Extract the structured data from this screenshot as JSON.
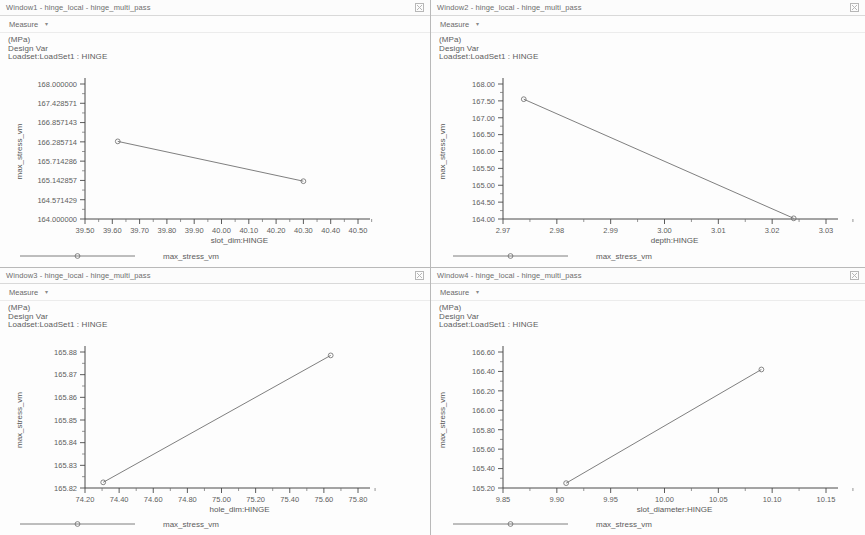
{
  "panels": [
    {
      "id": "window1",
      "title": "Window1 - hinge_local - hinge_multi_pass",
      "menu_label": "Measure",
      "caret": "▾",
      "close_icon": "window-close-icon",
      "legend_lines": [
        "(MPa)",
        "Design Var",
        "Loadset:LoadSet1 : HINGE"
      ],
      "footer_series_label": "max_stress_vm",
      "chart_data": {
        "type": "line",
        "title": "",
        "xlabel": "slot_dim:HINGE",
        "ylabel": "max_stress_vm",
        "xlim": [
          39.5,
          40.5
        ],
        "ylim": [
          164.0,
          168.0
        ],
        "xticks": [
          "39.50",
          "39.60",
          "39.70",
          "39.80",
          "39.90",
          "40.00",
          "40.10",
          "40.20",
          "40.30",
          "40.40",
          "40.50"
        ],
        "yticks": [
          "168.000000",
          "167.428571",
          "166.857143",
          "166.285714",
          "165.714286",
          "165.142857",
          "164.571429",
          "164.000000"
        ],
        "grid": false,
        "legend_position": "bottom",
        "series": [
          {
            "name": "max_stress_vm",
            "x": [
              39.62,
              40.3
            ],
            "y": [
              166.3,
              165.12
            ]
          }
        ]
      }
    },
    {
      "id": "window2",
      "title": "Window2 - hinge_local - hinge_multi_pass",
      "menu_label": "Measure",
      "caret": "▾",
      "close_icon": "window-close-icon",
      "legend_lines": [
        "(MPa)",
        "Design Var",
        "Loadset:LoadSet1 : HINGE"
      ],
      "footer_series_label": "max_stress_vm",
      "chart_data": {
        "type": "line",
        "title": "",
        "xlabel": "depth:HINGE",
        "ylabel": "max_stress_vm",
        "xlim": [
          2.965,
          3.035
        ],
        "ylim": [
          164.0,
          168.0
        ],
        "xticks": [
          "2.97",
          "2.98",
          "2.99",
          "3.00",
          "3.01",
          "3.02",
          "3.03"
        ],
        "yticks": [
          "168.00",
          "167.50",
          "167.00",
          "166.50",
          "166.00",
          "165.50",
          "165.00",
          "164.50",
          "164.00"
        ],
        "grid": false,
        "legend_position": "bottom",
        "series": [
          {
            "name": "max_stress_vm",
            "x": [
              2.9695,
              3.028
            ],
            "y": [
              167.55,
              164.02
            ]
          }
        ]
      }
    },
    {
      "id": "window3",
      "title": "Window3 - hinge_local - hinge_multi_pass",
      "menu_label": "Measure",
      "caret": "▾",
      "close_icon": "window-close-icon",
      "legend_lines": [
        "(MPa)",
        "Design Var",
        "Loadset:LoadSet1 : HINGE"
      ],
      "footer_series_label": "max_stress_vm",
      "chart_data": {
        "type": "line",
        "title": "",
        "xlabel": "hole_dim:HINGE",
        "ylabel": "max_stress_vm",
        "xlim": [
          74.1,
          75.9
        ],
        "ylim": [
          165.82,
          165.88
        ],
        "xticks": [
          "74.20",
          "74.40",
          "74.60",
          "74.80",
          "75.00",
          "75.20",
          "75.40",
          "75.60",
          "75.80"
        ],
        "yticks": [
          "165.88",
          "165.87",
          "165.86",
          "165.85",
          "165.84",
          "165.83",
          "165.82"
        ],
        "grid": false,
        "legend_position": "bottom",
        "series": [
          {
            "name": "max_stress_vm",
            "x": [
              74.22,
              75.72
            ],
            "y": [
              165.8225,
              165.8785
            ]
          }
        ]
      }
    },
    {
      "id": "window4",
      "title": "Window4 - hinge_local - hinge_multi_pass",
      "menu_label": "Measure",
      "caret": "▾",
      "close_icon": "window-close-icon",
      "legend_lines": [
        "(MPa)",
        "Design Var",
        "Loadset:LoadSet1 : HINGE"
      ],
      "footer_series_label": "max_stress_vm",
      "chart_data": {
        "type": "line",
        "title": "",
        "xlabel": "slot_diameter:HINGE",
        "ylabel": "max_stress_vm",
        "xlim": [
          9.835,
          10.165
        ],
        "ylim": [
          165.2,
          166.6
        ],
        "xticks": [
          "9.85",
          "9.90",
          "9.95",
          "10.00",
          "10.05",
          "10.10",
          "10.15"
        ],
        "yticks": [
          "166.60",
          "166.40",
          "166.20",
          "166.00",
          "165.80",
          "165.60",
          "165.40",
          "165.20"
        ],
        "grid": false,
        "legend_position": "bottom",
        "series": [
          {
            "name": "max_stress_vm",
            "x": [
              9.8995,
              10.099
            ],
            "y": [
              165.25,
              166.42
            ]
          }
        ]
      }
    }
  ],
  "colors": {
    "line": "#707070",
    "axis": "#4a4a4a",
    "text": "#5c5c5c",
    "panel_bg": "#fdfdfd",
    "border": "#b9b9b9"
  }
}
